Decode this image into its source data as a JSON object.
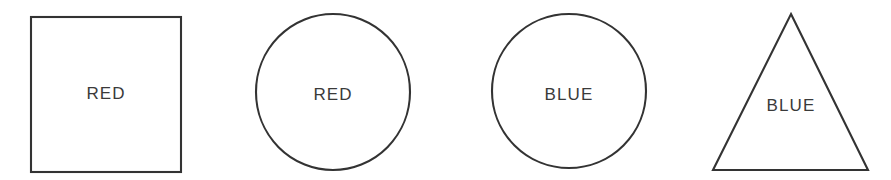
{
  "scene": {
    "title": "Shapes with color word labels",
    "background_color": "#ffffff",
    "stroke_color": "#333333",
    "text_color": "#3a3a3a",
    "width": 891,
    "height": 180
  },
  "shapes": [
    {
      "id": "square-red",
      "shape": "square",
      "label": "RED",
      "label_x": 106,
      "label_y": 95,
      "geometry": {
        "x": 31,
        "y": 17,
        "width": 150,
        "height": 155
      }
    },
    {
      "id": "circle-red",
      "shape": "circle",
      "label": "RED",
      "label_x": 333,
      "label_y": 96,
      "geometry": {
        "cx": 333,
        "cy": 92,
        "rx": 77,
        "ry": 78
      }
    },
    {
      "id": "circle-blue",
      "shape": "circle",
      "label": "BLUE",
      "label_x": 569,
      "label_y": 96,
      "geometry": {
        "cx": 569,
        "cy": 91,
        "rx": 77,
        "ry": 77
      }
    },
    {
      "id": "triangle-blue",
      "shape": "triangle",
      "label": "BLUE",
      "label_x": 791,
      "label_y": 107,
      "geometry": {
        "apex_x": 791,
        "apex_y": 14,
        "left_x": 713,
        "left_y": 170,
        "right_x": 868,
        "right_y": 170
      }
    }
  ]
}
